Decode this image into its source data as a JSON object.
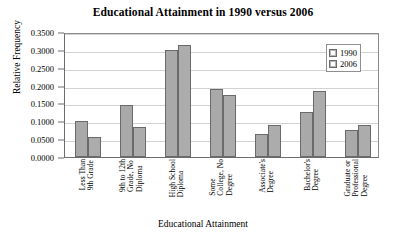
{
  "chart_data": {
    "type": "bar",
    "title": "Educational Attainment in 1990 versus 2006",
    "xlabel": "Educational Attainment",
    "ylabel": "Relative Frequency",
    "ylim": [
      0.0,
      0.35
    ],
    "ytick_labels": [
      "0.3500",
      "0.3000",
      "0.2500",
      "0.2000",
      "0.1500",
      "0.1000",
      "0.0500",
      "0.0000"
    ],
    "ytick_values": [
      0.35,
      0.3,
      0.25,
      0.2,
      0.15,
      0.1,
      0.05,
      0.0
    ],
    "grid": true,
    "legend_position": "top-right",
    "categories": [
      "Less Than 9th Grade",
      "9th to 12th Grade, No Diploma",
      "High School Diploma",
      "Some College, No Degree",
      "Associate's Degree",
      "Bachelor's Degree",
      "Graduate or Professional Degree"
    ],
    "category_lines": [
      [
        "Less Than",
        "9th Grade"
      ],
      [
        "9th to 12th",
        "Grade, No",
        "Diploma"
      ],
      [
        "High School",
        "Diploma"
      ],
      [
        "Some",
        "College, No",
        "Degree"
      ],
      [
        "Associate's",
        "Degree"
      ],
      [
        "Bachelor's",
        "Degree"
      ],
      [
        "Graduate or",
        "Professional",
        "Degree"
      ]
    ],
    "series": [
      {
        "name": "1990",
        "color": "#a9a9a9",
        "values": [
          0.1,
          0.145,
          0.3,
          0.19,
          0.065,
          0.125,
          0.075
        ]
      },
      {
        "name": "2006",
        "color": "#acacac",
        "values": [
          0.055,
          0.085,
          0.315,
          0.175,
          0.09,
          0.185,
          0.09
        ]
      }
    ]
  },
  "legend": {
    "entries": [
      {
        "label": "1990"
      },
      {
        "label": "2006"
      }
    ]
  }
}
